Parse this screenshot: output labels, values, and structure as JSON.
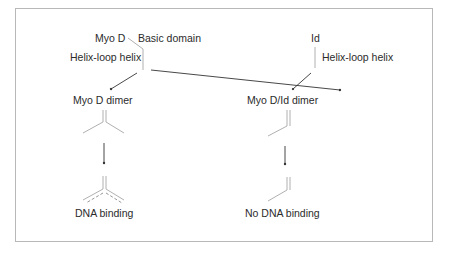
{
  "diagram": {
    "left": {
      "protein_label": "Myo D",
      "domain_label": "Basic domain",
      "helix_label": "Helix-loop helix",
      "dimer_label": "Myo D dimer",
      "outcome_label": "DNA binding"
    },
    "right": {
      "protein_label": "Id",
      "helix_label": "Helix-loop helix",
      "dimer_label": "Myo D/Id dimer",
      "outcome_label": "No DNA binding"
    },
    "colors": {
      "frame": "#b8b8b8",
      "structure_lines": "#b0b0b0",
      "arrows": "#333333",
      "text": "#2b2b2b"
    }
  }
}
